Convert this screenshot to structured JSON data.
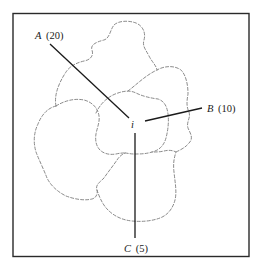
{
  "diagram": {
    "center": {
      "label": "i"
    },
    "points": [
      {
        "id": "A",
        "letter": "A",
        "value": "(20)"
      },
      {
        "id": "B",
        "letter": "B",
        "value": "(10)"
      },
      {
        "id": "C",
        "letter": "C",
        "value": "(5)"
      }
    ],
    "colors": {
      "frame": "#2a2a2a",
      "rays": "#1a1a1a",
      "regions_dashed": "#7d7d7d",
      "background": "#ffffff"
    }
  }
}
